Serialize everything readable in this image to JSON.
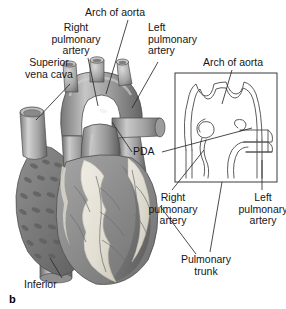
{
  "figure": {
    "panel_letter": "b",
    "caption_labels": {
      "right_pulmonary_artery": "Right\npulmonary\nartery",
      "superior_vena_cava": "Superior\nvena cava",
      "arch_of_aorta": "Arch of aorta",
      "left_pulmonary_artery": "Left\npulmonary\nartery",
      "pda": "PDA",
      "inferior": "Inferior",
      "pulmonary_trunk": "Pulmonary\ntrunk"
    },
    "inset": {
      "arch_of_aorta": "Arch of aorta",
      "right_pulmonary_artery": "Right\npulmonary\nartery",
      "left_pulmonary_artery": "Left\npulmonary\nartery"
    },
    "colors": {
      "background": "#ffffff",
      "text": "#161616",
      "leader_line": "#2a2a2a",
      "inset_border": "#3a3a3a",
      "inset_line": "#4a4a4a",
      "vessel_mid": "#9a9a9a",
      "vessel_dark": "#5d5d5d",
      "vessel_light": "#d8d8d8",
      "myocardium": "#8c8c8c",
      "myocardium_dark": "#6a6a6a",
      "epicardial_fat": "#e6e2d8",
      "atrium_texture": "#7e7e7e"
    }
  }
}
